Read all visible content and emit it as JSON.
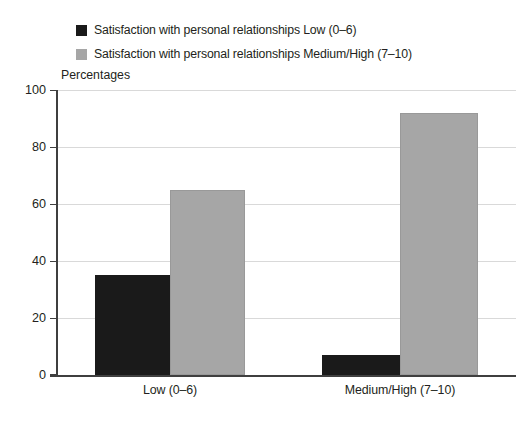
{
  "chart_data": {
    "type": "bar",
    "title": "",
    "subtitle": "",
    "ylabel": "Percentages",
    "xlabel": "",
    "ylim": [
      0,
      100
    ],
    "ytick_labels": [
      "100",
      "80",
      "60",
      "40",
      "20",
      "0"
    ],
    "yticks": [
      100,
      80,
      60,
      40,
      20,
      0
    ],
    "grid": true,
    "legend_position": "top-left",
    "categories": [
      "Low (0–6)",
      "Medium/High (7–10)"
    ],
    "series": [
      {
        "name": "Satisfaction with personal relationships Low (0–6)",
        "color": "#1a1a1a",
        "values": [
          35,
          7
        ]
      },
      {
        "name": "Satisfaction with personal relationships Medium/High (7–10)",
        "color": "#a6a6a6",
        "values": [
          65,
          92
        ]
      }
    ]
  },
  "legend": {
    "items": [
      {
        "label": "Satisfaction with personal relationships Low (0–6)",
        "swatch": "dark"
      },
      {
        "label": "Satisfaction with personal relationships Medium/High (7–10)",
        "swatch": "gray"
      }
    ]
  },
  "axis": {
    "y_title": "Percentages"
  },
  "colors": {
    "series_dark": "#1a1a1a",
    "series_gray": "#a6a6a6",
    "gridline": "#d9d9d9",
    "axis": "#3f3f3f",
    "text": "#231f20",
    "background": "#ffffff"
  }
}
